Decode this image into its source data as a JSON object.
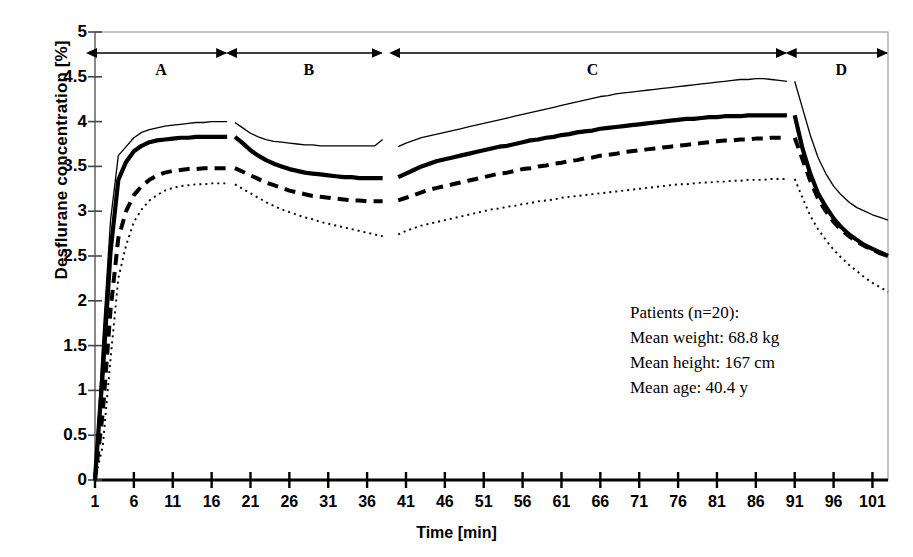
{
  "chart_data": {
    "type": "line",
    "title": "",
    "xlabel": "Time [min]",
    "ylabel": "Desflurane concentration [%]",
    "xlim": [
      1,
      103
    ],
    "ylim": [
      0,
      5
    ],
    "grid": false,
    "legend_position": "none",
    "xticks": [
      1,
      6,
      11,
      16,
      21,
      26,
      31,
      36,
      41,
      46,
      51,
      56,
      61,
      66,
      71,
      76,
      81,
      86,
      91,
      96,
      101
    ],
    "yticks": [
      0,
      0.5,
      1,
      1.5,
      2,
      2.5,
      3,
      3.5,
      4,
      4.5,
      5
    ],
    "phases": [
      {
        "label": "A",
        "start": 1,
        "end": 18
      },
      {
        "label": "B",
        "start": 19,
        "end": 38
      },
      {
        "label": "C",
        "start": 40,
        "end": 90
      },
      {
        "label": "D",
        "start": 91,
        "end": 103
      }
    ],
    "series": [
      {
        "name": "upper-thin-solid",
        "style": "thin-solid",
        "segments": [
          {
            "x": [
              1,
              2,
              3,
              4,
              5,
              6,
              7,
              8,
              9,
              10,
              11,
              12,
              13,
              14,
              15,
              16,
              17,
              18
            ],
            "y": [
              0.05,
              1.55,
              2.9,
              3.62,
              3.72,
              3.82,
              3.88,
              3.91,
              3.93,
              3.95,
              3.96,
              3.97,
              3.98,
              3.99,
              3.99,
              4.0,
              4.0,
              4.0
            ]
          },
          {
            "x": [
              19,
              20,
              21,
              22,
              23,
              24,
              25,
              26,
              27,
              28,
              29,
              30,
              31,
              32,
              33,
              34,
              35,
              36,
              37,
              38
            ],
            "y": [
              3.99,
              3.93,
              3.87,
              3.83,
              3.8,
              3.78,
              3.77,
              3.76,
              3.75,
              3.74,
              3.74,
              3.73,
              3.73,
              3.73,
              3.73,
              3.73,
              3.73,
              3.73,
              3.73,
              3.8
            ]
          },
          {
            "x": [
              40,
              41,
              42,
              43,
              44,
              45,
              46,
              47,
              48,
              49,
              50,
              51,
              52,
              53,
              54,
              55,
              56,
              57,
              58,
              59,
              60,
              61,
              62,
              63,
              64,
              65,
              66,
              67,
              68,
              69,
              70,
              71,
              72,
              73,
              74,
              75,
              76,
              77,
              78,
              79,
              80,
              81,
              82,
              83,
              84,
              85,
              86,
              87,
              88,
              89,
              90
            ],
            "y": [
              3.72,
              3.76,
              3.79,
              3.82,
              3.84,
              3.86,
              3.88,
              3.9,
              3.92,
              3.94,
              3.96,
              3.98,
              4.0,
              4.02,
              4.04,
              4.06,
              4.08,
              4.1,
              4.12,
              4.14,
              4.16,
              4.18,
              4.2,
              4.22,
              4.24,
              4.26,
              4.28,
              4.29,
              4.31,
              4.32,
              4.33,
              4.34,
              4.35,
              4.36,
              4.37,
              4.38,
              4.39,
              4.4,
              4.41,
              4.42,
              4.43,
              4.44,
              4.45,
              4.46,
              4.47,
              4.47,
              4.48,
              4.48,
              4.47,
              4.46,
              4.45
            ]
          },
          {
            "x": [
              91,
              92,
              93,
              94,
              95,
              96,
              97,
              98,
              99,
              100,
              101,
              102,
              103
            ],
            "y": [
              4.45,
              4.15,
              3.85,
              3.6,
              3.42,
              3.28,
              3.18,
              3.1,
              3.04,
              3.0,
              2.96,
              2.93,
              2.9
            ]
          }
        ]
      },
      {
        "name": "mean-thick-solid",
        "style": "thick-solid",
        "segments": [
          {
            "x": [
              1,
              2,
              3,
              4,
              5,
              6,
              7,
              8,
              9,
              10,
              11,
              12,
              13,
              14,
              15,
              16,
              17,
              18
            ],
            "y": [
              0.02,
              1.2,
              2.55,
              3.35,
              3.55,
              3.67,
              3.73,
              3.77,
              3.79,
              3.8,
              3.81,
              3.82,
              3.82,
              3.83,
              3.83,
              3.83,
              3.83,
              3.83
            ]
          },
          {
            "x": [
              19,
              20,
              21,
              22,
              23,
              24,
              25,
              26,
              27,
              28,
              29,
              30,
              31,
              32,
              33,
              34,
              35,
              36,
              37,
              38
            ],
            "y": [
              3.83,
              3.76,
              3.68,
              3.62,
              3.57,
              3.53,
              3.5,
              3.47,
              3.45,
              3.43,
              3.42,
              3.41,
              3.4,
              3.39,
              3.38,
              3.38,
              3.37,
              3.37,
              3.37,
              3.37
            ]
          },
          {
            "x": [
              40,
              41,
              42,
              43,
              44,
              45,
              46,
              47,
              48,
              49,
              50,
              51,
              52,
              53,
              54,
              55,
              56,
              57,
              58,
              59,
              60,
              61,
              62,
              63,
              64,
              65,
              66,
              67,
              68,
              69,
              70,
              71,
              72,
              73,
              74,
              75,
              76,
              77,
              78,
              79,
              80,
              81,
              82,
              83,
              84,
              85,
              86,
              87,
              88,
              89,
              90
            ],
            "y": [
              3.38,
              3.42,
              3.46,
              3.5,
              3.53,
              3.56,
              3.58,
              3.6,
              3.62,
              3.64,
              3.66,
              3.68,
              3.7,
              3.72,
              3.73,
              3.75,
              3.77,
              3.79,
              3.8,
              3.82,
              3.83,
              3.85,
              3.86,
              3.88,
              3.89,
              3.9,
              3.92,
              3.93,
              3.94,
              3.95,
              3.96,
              3.97,
              3.98,
              3.99,
              4.0,
              4.01,
              4.02,
              4.03,
              4.03,
              4.04,
              4.05,
              4.05,
              4.06,
              4.06,
              4.06,
              4.07,
              4.07,
              4.07,
              4.07,
              4.07,
              4.07
            ]
          },
          {
            "x": [
              91,
              92,
              93,
              94,
              95,
              96,
              97,
              98,
              99,
              100,
              101,
              102,
              103
            ],
            "y": [
              4.07,
              3.7,
              3.42,
              3.2,
              3.05,
              2.92,
              2.82,
              2.74,
              2.68,
              2.62,
              2.58,
              2.54,
              2.5
            ]
          }
        ]
      },
      {
        "name": "lower-thick-dashed",
        "style": "thick-dashed",
        "segments": [
          {
            "x": [
              1,
              2,
              3,
              4,
              5,
              6,
              7,
              8,
              9,
              10,
              11,
              12,
              13,
              14,
              15,
              16,
              17,
              18
            ],
            "y": [
              0.0,
              0.75,
              1.9,
              2.7,
              3.0,
              3.18,
              3.28,
              3.35,
              3.4,
              3.43,
              3.45,
              3.46,
              3.47,
              3.47,
              3.48,
              3.48,
              3.48,
              3.48
            ]
          },
          {
            "x": [
              19,
              20,
              21,
              22,
              23,
              24,
              25,
              26,
              27,
              28,
              29,
              30,
              31,
              32,
              33,
              34,
              35,
              36,
              37,
              38
            ],
            "y": [
              3.48,
              3.44,
              3.4,
              3.36,
              3.32,
              3.29,
              3.26,
              3.23,
              3.21,
              3.19,
              3.17,
              3.16,
              3.15,
              3.14,
              3.13,
              3.12,
              3.12,
              3.11,
              3.11,
              3.11
            ]
          },
          {
            "x": [
              40,
              41,
              42,
              43,
              44,
              45,
              46,
              47,
              48,
              49,
              50,
              51,
              52,
              53,
              54,
              55,
              56,
              57,
              58,
              59,
              60,
              61,
              62,
              63,
              64,
              65,
              66,
              67,
              68,
              69,
              70,
              71,
              72,
              73,
              74,
              75,
              76,
              77,
              78,
              79,
              80,
              81,
              82,
              83,
              84,
              85,
              86,
              87,
              88,
              89,
              90
            ],
            "y": [
              3.12,
              3.15,
              3.18,
              3.21,
              3.24,
              3.26,
              3.28,
              3.3,
              3.32,
              3.34,
              3.36,
              3.38,
              3.4,
              3.42,
              3.43,
              3.45,
              3.47,
              3.48,
              3.5,
              3.51,
              3.53,
              3.54,
              3.56,
              3.57,
              3.59,
              3.6,
              3.62,
              3.63,
              3.64,
              3.66,
              3.67,
              3.68,
              3.69,
              3.7,
              3.71,
              3.72,
              3.73,
              3.74,
              3.75,
              3.76,
              3.77,
              3.78,
              3.79,
              3.79,
              3.8,
              3.8,
              3.81,
              3.81,
              3.82,
              3.82,
              3.82
            ]
          },
          {
            "x": [
              91,
              92,
              93,
              94,
              95,
              96,
              97,
              98,
              99,
              100,
              101,
              102,
              103
            ],
            "y": [
              3.82,
              3.58,
              3.34,
              3.14,
              3.0,
              2.88,
              2.79,
              2.72,
              2.66,
              2.61,
              2.57,
              2.53,
              2.5
            ]
          }
        ]
      },
      {
        "name": "lowest-dotted",
        "style": "dotted",
        "segments": [
          {
            "x": [
              1,
              2,
              3,
              4,
              5,
              6,
              7,
              8,
              9,
              10,
              11,
              12,
              13,
              14,
              15,
              16,
              17,
              18
            ],
            "y": [
              0.0,
              0.38,
              1.35,
              2.25,
              2.62,
              2.88,
              3.02,
              3.12,
              3.18,
              3.23,
              3.26,
              3.28,
              3.29,
              3.3,
              3.3,
              3.31,
              3.31,
              3.31
            ]
          },
          {
            "x": [
              19,
              20,
              21,
              22,
              23,
              24,
              25,
              26,
              27,
              28,
              29,
              30,
              31,
              32,
              33,
              34,
              35,
              36,
              37,
              38
            ],
            "y": [
              3.3,
              3.25,
              3.2,
              3.15,
              3.1,
              3.06,
              3.02,
              2.99,
              2.96,
              2.93,
              2.91,
              2.88,
              2.86,
              2.84,
              2.82,
              2.8,
              2.78,
              2.76,
              2.74,
              2.72
            ]
          },
          {
            "x": [
              40,
              41,
              42,
              43,
              44,
              45,
              46,
              47,
              48,
              49,
              50,
              51,
              52,
              53,
              54,
              55,
              56,
              57,
              58,
              59,
              60,
              61,
              62,
              63,
              64,
              65,
              66,
              67,
              68,
              69,
              70,
              71,
              72,
              73,
              74,
              75,
              76,
              77,
              78,
              79,
              80,
              81,
              82,
              83,
              84,
              85,
              86,
              87,
              88,
              89,
              90
            ],
            "y": [
              2.74,
              2.78,
              2.81,
              2.84,
              2.86,
              2.88,
              2.9,
              2.92,
              2.94,
              2.96,
              2.98,
              3.0,
              3.02,
              3.03,
              3.05,
              3.06,
              3.08,
              3.09,
              3.11,
              3.12,
              3.13,
              3.15,
              3.16,
              3.17,
              3.18,
              3.19,
              3.2,
              3.21,
              3.22,
              3.23,
              3.24,
              3.25,
              3.26,
              3.27,
              3.28,
              3.29,
              3.3,
              3.3,
              3.31,
              3.32,
              3.32,
              3.33,
              3.33,
              3.34,
              3.34,
              3.35,
              3.35,
              3.35,
              3.36,
              3.36,
              3.36
            ]
          },
          {
            "x": [
              91,
              92,
              93,
              94,
              95,
              96,
              97,
              98,
              99,
              100,
              101,
              102,
              103
            ],
            "y": [
              3.36,
              3.15,
              2.95,
              2.8,
              2.68,
              2.57,
              2.48,
              2.4,
              2.33,
              2.26,
              2.2,
              2.15,
              2.1
            ]
          }
        ]
      }
    ],
    "annotation": {
      "line1": "Patients (n=20):",
      "line2": "Mean weight:  68.8 kg",
      "line3": "Mean height:  167 cm",
      "line4": "Mean age:  40.4 y"
    }
  }
}
